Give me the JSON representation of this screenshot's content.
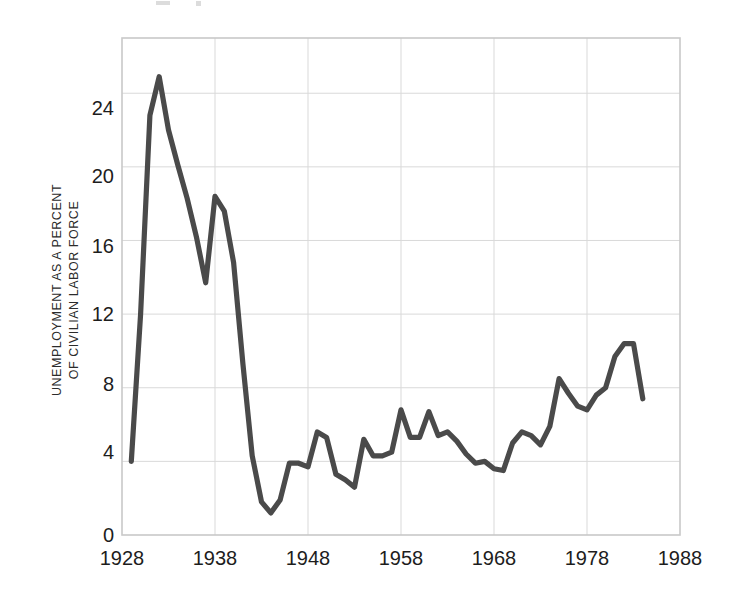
{
  "chart_data": {
    "type": "line",
    "title": "",
    "subtitle": "",
    "xlabel": "",
    "ylabel": "UNEMPLOYMENT AS A PERCENT OF CIVILIAN LABOR FORCE",
    "ylabel_line1": "UNEMPLOYMENT AS A PERCENT",
    "ylabel_line2": "OF CIVILIAN LABOR FORCE",
    "xlim": [
      1928,
      1988
    ],
    "ylim": [
      0,
      27
    ],
    "xticks": [
      1928,
      1938,
      1948,
      1958,
      1968,
      1978,
      1988
    ],
    "yticks": [
      0,
      4,
      8,
      12,
      16,
      20,
      24
    ],
    "xtick_labels": [
      "1928",
      "1938",
      "1948",
      "1958",
      "1968",
      "1978",
      "1988"
    ],
    "ytick_labels": [
      "0",
      "4",
      "8",
      "12",
      "16",
      "20",
      "24"
    ],
    "grid": true,
    "legend": "none",
    "line_color": "#4a4a4a",
    "grid_color": "#d9d9d9",
    "frame_color": "#c9c9c9",
    "background_color": "#ffffff",
    "series": [
      {
        "name": "Unemployment rate",
        "x": [
          1929,
          1930,
          1931,
          1932,
          1933,
          1934,
          1935,
          1936,
          1937,
          1938,
          1939,
          1940,
          1941,
          1942,
          1943,
          1944,
          1945,
          1946,
          1947,
          1948,
          1949,
          1950,
          1951,
          1952,
          1953,
          1954,
          1955,
          1956,
          1957,
          1958,
          1959,
          1960,
          1961,
          1962,
          1963,
          1964,
          1965,
          1966,
          1967,
          1968,
          1969,
          1970,
          1971,
          1972,
          1973,
          1974,
          1975,
          1976,
          1977,
          1978,
          1979,
          1980,
          1981,
          1982,
          1983,
          1984
        ],
        "values": [
          4.0,
          12.0,
          22.8,
          24.9,
          22.0,
          20.1,
          18.3,
          16.2,
          13.7,
          18.4,
          17.6,
          14.8,
          9.3,
          4.3,
          1.8,
          1.2,
          1.9,
          3.9,
          3.9,
          3.7,
          5.6,
          5.3,
          3.3,
          3.0,
          2.6,
          5.2,
          4.3,
          4.3,
          4.5,
          6.8,
          5.3,
          5.3,
          6.7,
          5.4,
          5.6,
          5.1,
          4.4,
          3.9,
          4.0,
          3.6,
          3.5,
          5.0,
          5.6,
          5.4,
          4.9,
          5.9,
          8.5,
          7.7,
          7.0,
          6.8,
          7.6,
          8.0,
          9.7,
          10.4,
          10.4,
          7.4
        ]
      }
    ]
  },
  "axis": {
    "y_caption_line1": "UNEMPLOYMENT AS A PERCENT",
    "y_caption_line2": "OF CIVILIAN LABOR FORCE"
  }
}
